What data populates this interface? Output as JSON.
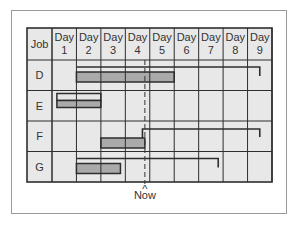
{
  "chart_data": {
    "type": "gantt",
    "title": "",
    "header": {
      "job_label": "Job",
      "day_labels": [
        [
          "Day",
          "1"
        ],
        [
          "Day",
          "2"
        ],
        [
          "Day",
          "3"
        ],
        [
          "Day",
          "4"
        ],
        [
          "Day",
          "5"
        ],
        [
          "Day",
          "6"
        ],
        [
          "Day",
          "7"
        ],
        [
          "Day",
          "8"
        ],
        [
          "Day",
          "9"
        ]
      ]
    },
    "jobs": [
      {
        "name": "D",
        "planned": {
          "start": 2.0,
          "end": 9.5,
          "bracket": true
        },
        "actual": {
          "start": 2.0,
          "end": 6.0
        }
      },
      {
        "name": "E",
        "planned": {
          "start": 1.2,
          "end": 3.0,
          "bracket": false
        },
        "actual": {
          "start": 1.2,
          "end": 3.0
        }
      },
      {
        "name": "F",
        "planned": {
          "start": 4.7,
          "end": 9.5,
          "bracket": true
        },
        "actual": {
          "start": 3.0,
          "end": 4.8
        }
      },
      {
        "name": "G",
        "planned": {
          "start": 2.0,
          "end": 7.8,
          "bracket": true
        },
        "actual": {
          "start": 2.0,
          "end": 3.8
        }
      }
    ],
    "now_marker": {
      "day": 4.8,
      "label": "Now",
      "caret": "^"
    },
    "grid": true,
    "colors": {
      "cell_bg": "#e8e8e8",
      "grid_line": "#2e2e2e",
      "actual_bar": "#aaaaaa",
      "planned_box": "#e6e6e6",
      "frame": "#9a9a9a"
    }
  }
}
